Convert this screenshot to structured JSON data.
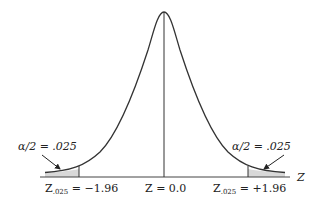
{
  "diagram": {
    "type": "normal-distribution-two-tailed",
    "colors": {
      "curve": "#333333",
      "axis": "#444444",
      "shade": "#d8d8d8"
    },
    "labels": {
      "left_tail": "α/2 = .025",
      "right_tail": "α/2 = .025",
      "axis_name": "Z",
      "left_critical_main": "Z",
      "left_critical_sub": ".025",
      "left_critical_value": " = −1.96",
      "center": "Z = 0.0",
      "right_critical_main": "Z",
      "right_critical_sub": ".025",
      "right_critical_value": " = +1.96"
    }
  }
}
